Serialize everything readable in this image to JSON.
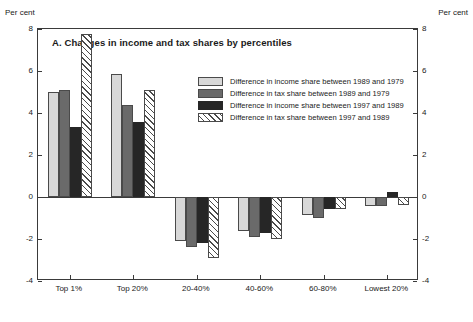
{
  "axis_captions": {
    "left": "Per cent",
    "right": "Per cent"
  },
  "chart_data": {
    "type": "bar",
    "title": "A.  Changes in income and tax shares by percentiles",
    "xlabel": "",
    "ylabel": "Per cent",
    "ylim": [
      -4,
      8
    ],
    "yticks": [
      8,
      6,
      4,
      2,
      0,
      -2,
      -4
    ],
    "ytick_labels": [
      "8",
      "6",
      "4",
      "2",
      "0",
      "-2",
      "-4"
    ],
    "grid": false,
    "legend_position": "top-center-right",
    "categories": [
      "Top 1%",
      "Top 20%",
      "20-40%",
      "40-60%",
      "60-80%",
      "Lowest 20%"
    ],
    "series": [
      {
        "name": "Difference in income share between 1989 and 1979",
        "color": "#d8d8d8",
        "values": [
          5.0,
          5.85,
          -2.1,
          -1.6,
          -0.85,
          -0.45
        ]
      },
      {
        "name": "Difference in tax share between 1989 and 1979",
        "color": "#6a6a6a",
        "values": [
          5.1,
          4.4,
          -2.4,
          -1.9,
          -1.0,
          -0.45
        ]
      },
      {
        "name": "Difference in income share between 1997 and 1989",
        "color": "#262626",
        "values": [
          3.35,
          3.55,
          -2.2,
          -1.7,
          -0.55,
          0.25
        ]
      },
      {
        "name": "Difference in tax share between 1997 and 1989",
        "color": "#ffffff",
        "pattern": "diagonal-hatch",
        "values": [
          7.75,
          5.1,
          -2.9,
          -2.0,
          -0.55,
          -0.4
        ]
      }
    ]
  }
}
